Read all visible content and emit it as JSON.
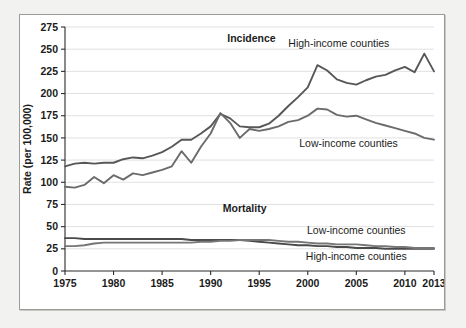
{
  "figure": {
    "background_color": "#f2f2f0",
    "panel_color": "#ffffff",
    "border_color": "#9a9a96"
  },
  "axes": {
    "y_axis_title": "Rate (per 100,000)",
    "y_tick_labels": [
      "0",
      "25",
      "50",
      "75",
      "100",
      "125",
      "150",
      "175",
      "200",
      "225",
      "250",
      "275"
    ],
    "x_tick_labels": [
      "1975",
      "1980",
      "1985",
      "1990",
      "1995",
      "2000",
      "2005",
      "2010",
      "2013"
    ]
  },
  "annotations": {
    "incidence_group": "Incidence",
    "mortality_group": "Mortality",
    "incidence_high": "High-income counties",
    "incidence_low": "Low-income counties",
    "mortality_low": "Low-income counties",
    "mortality_high": "High-income counties"
  },
  "chart_data": {
    "type": "line",
    "title": "",
    "xlabel": "",
    "ylabel": "Rate (per 100,000)",
    "xlim": [
      1975,
      2013
    ],
    "ylim": [
      0,
      275
    ],
    "ytick_step": 25,
    "xticks": [
      1975,
      1980,
      1985,
      1990,
      1995,
      2000,
      2005,
      2010,
      2013
    ],
    "grid": "horizontal",
    "legend_position": "inline-annotations",
    "line_color": "#595959",
    "x": [
      1975,
      1976,
      1977,
      1978,
      1979,
      1980,
      1981,
      1982,
      1983,
      1984,
      1985,
      1986,
      1987,
      1988,
      1989,
      1990,
      1991,
      1992,
      1993,
      1994,
      1995,
      1996,
      1997,
      1998,
      1999,
      2000,
      2001,
      2002,
      2003,
      2004,
      2005,
      2006,
      2007,
      2008,
      2009,
      2010,
      2011,
      2012,
      2013
    ],
    "series": [
      {
        "name": "Incidence, High-income counties",
        "values": [
          118,
          121,
          122,
          121,
          122,
          122,
          126,
          128,
          127,
          130,
          134,
          140,
          148,
          148,
          155,
          163,
          177,
          172,
          163,
          162,
          162,
          166,
          175,
          186,
          196,
          207,
          232,
          226,
          216,
          212,
          210,
          215,
          219,
          221,
          226,
          230,
          224,
          245,
          225
        ]
      },
      {
        "name": "Incidence, Low-income counties",
        "values": [
          95,
          94,
          97,
          106,
          99,
          108,
          103,
          110,
          108,
          111,
          114,
          118,
          135,
          122,
          140,
          155,
          178,
          167,
          150,
          160,
          158,
          160,
          163,
          168,
          170,
          175,
          183,
          182,
          176,
          174,
          175,
          171,
          167,
          164,
          161,
          158,
          155,
          150,
          148
        ]
      },
      {
        "name": "Mortality, High-income counties",
        "values": [
          37,
          37,
          36,
          36,
          36,
          36,
          36,
          36,
          36,
          36,
          36,
          36,
          36,
          35,
          35,
          35,
          35,
          35,
          35,
          34,
          33,
          32,
          31,
          30,
          29,
          29,
          28,
          28,
          27,
          27,
          26,
          26,
          26,
          25,
          25,
          25,
          25,
          25,
          25
        ]
      },
      {
        "name": "Mortality, Low-income counties",
        "values": [
          28,
          28,
          29,
          31,
          32,
          32,
          32,
          32,
          32,
          32,
          32,
          32,
          32,
          32,
          33,
          33,
          34,
          34,
          35,
          35,
          35,
          35,
          34,
          33,
          33,
          32,
          31,
          31,
          30,
          30,
          30,
          29,
          28,
          28,
          27,
          27,
          26,
          26,
          26
        ]
      }
    ]
  }
}
